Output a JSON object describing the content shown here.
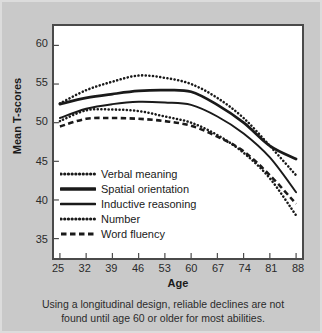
{
  "chart_data": {
    "type": "line",
    "title": "",
    "xlabel": "Age",
    "ylabel": "Mean T-scores",
    "xlim": [
      25,
      88
    ],
    "ylim": [
      33,
      62
    ],
    "grid": false,
    "legend_position": "inside-lower-left",
    "x": [
      25,
      32,
      39,
      46,
      53,
      60,
      67,
      74,
      81,
      88
    ],
    "xticks": [
      "25",
      "32",
      "39",
      "46",
      "53",
      "60",
      "67",
      "74",
      "81",
      "88"
    ],
    "yticks": [
      "35",
      "40",
      "45",
      "50",
      "55",
      "60"
    ],
    "ytick_values": [
      35,
      40,
      45,
      50,
      55,
      60
    ],
    "series": [
      {
        "name": "Verbal meaning",
        "style": "dotted",
        "color": "#1a1a1a",
        "values": [
          52.5,
          54.2,
          55.3,
          56.1,
          55.8,
          55.0,
          53.2,
          50.6,
          47.0,
          43.2
        ]
      },
      {
        "name": "Spatial orientation",
        "style": "solid-thick",
        "color": "#1a1a1a",
        "values": [
          52.4,
          53.2,
          53.7,
          54.1,
          54.2,
          54.0,
          52.3,
          50.0,
          47.0,
          45.3
        ]
      },
      {
        "name": "Inductive reasoning",
        "style": "solid",
        "color": "#1a1a1a",
        "values": [
          50.6,
          51.8,
          52.4,
          52.7,
          52.6,
          52.3,
          50.8,
          48.6,
          45.5,
          41.0
        ]
      },
      {
        "name": "Number",
        "style": "dotted",
        "color": "#1a1a1a",
        "values": [
          50.2,
          51.6,
          51.7,
          51.5,
          50.8,
          50.0,
          48.4,
          46.1,
          42.8,
          38.0
        ]
      },
      {
        "name": "Word fluency",
        "style": "dashed",
        "color": "#1a1a1a",
        "values": [
          49.5,
          50.5,
          50.6,
          50.5,
          50.2,
          49.6,
          48.2,
          46.3,
          43.2,
          39.5
        ]
      }
    ]
  },
  "caption": {
    "line1": "Using a longitudinal design, reliable declines are not",
    "line2": "found until age 60 or older for most abilities."
  },
  "colors": {
    "background": "#c9c9c9",
    "plot_background": "#ffffff",
    "axis": "#4a4a4a",
    "ink": "#1a1a1a"
  }
}
